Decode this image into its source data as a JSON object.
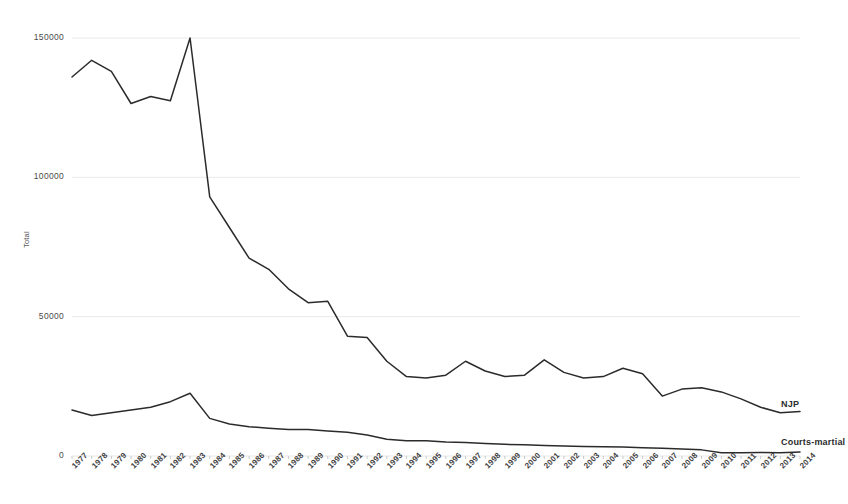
{
  "chart_data": {
    "type": "line",
    "title": "",
    "xlabel": "",
    "ylabel": "Total",
    "ylim": [
      0,
      150000
    ],
    "yticks": [
      0,
      50000,
      100000,
      150000
    ],
    "ytick_labels": [
      "0",
      "50000",
      "100000",
      "150000"
    ],
    "grid": true,
    "legend_position": "right-inline",
    "categories": [
      "1977",
      "1978",
      "1979",
      "1980",
      "1981",
      "1982",
      "1983",
      "1984",
      "1985",
      "1986",
      "1987",
      "1988",
      "1989",
      "1990",
      "1991",
      "1992",
      "1993",
      "1994",
      "1995",
      "1996",
      "1997",
      "1998",
      "1999",
      "2000",
      "2001",
      "2002",
      "2003",
      "2004",
      "2005",
      "2006",
      "2007",
      "2008",
      "2009",
      "2010",
      "2011",
      "2012",
      "2013",
      "2014"
    ],
    "series": [
      {
        "name": "NJP",
        "values": [
          136000,
          142000,
          138000,
          126500,
          129000,
          127500,
          150000,
          93000,
          82000,
          71000,
          67000,
          60000,
          55000,
          55500,
          43000,
          42500,
          34000,
          28500,
          28000,
          29000,
          34000,
          30500,
          28500,
          29000,
          34500,
          30000,
          28000,
          28500,
          31500,
          29500,
          21500,
          24000,
          24500,
          23000,
          20500,
          17500,
          15500,
          16000
        ]
      },
      {
        "name": "Courts-martial",
        "values": [
          16500,
          14500,
          15500,
          16500,
          17500,
          19500,
          22500,
          13500,
          11500,
          10500,
          10000,
          9500,
          9500,
          9000,
          8500,
          7500,
          6000,
          5500,
          5500,
          5000,
          4800,
          4500,
          4200,
          4000,
          3800,
          3600,
          3400,
          3300,
          3200,
          3000,
          2800,
          2500,
          2200,
          1200,
          1200,
          1300,
          1200,
          1400
        ]
      }
    ],
    "series_labels": [
      {
        "name": "NJP",
        "x": 781,
        "y": 399
      },
      {
        "name": "Courts-martial",
        "x": 781,
        "y": 437
      }
    ],
    "colors": {
      "line": "#2b2b2b",
      "grid": "#e8e8e8",
      "axis_text": "#3f3f3f",
      "background": "#ffffff"
    }
  }
}
